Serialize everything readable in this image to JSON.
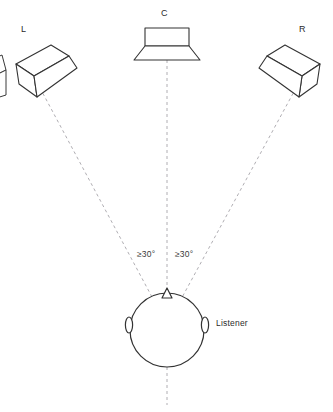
{
  "diagram": {
    "background_color": "#ffffff",
    "line_color": "#333333",
    "dashed_line_color": "#b0aeb3",
    "text_color": "#2b2b2b"
  },
  "labels": {
    "left_speaker": "L",
    "center_speaker": "C",
    "right_speaker": "R",
    "listener": "Listener",
    "angle_left": "≥30°",
    "angle_right": "≥30°"
  },
  "geometry": {
    "listener_point": {
      "x": 167,
      "y": 325
    },
    "head_center": {
      "x": 167,
      "y": 330
    },
    "head_radius": 37,
    "left_speaker_anchor": {
      "x": 40,
      "y": 88
    },
    "center_speaker_anchor": {
      "x": 167,
      "y": 60
    },
    "right_speaker_anchor": {
      "x": 296,
      "y": 88
    },
    "center_line_bottom": {
      "x": 167,
      "y": 405
    }
  }
}
